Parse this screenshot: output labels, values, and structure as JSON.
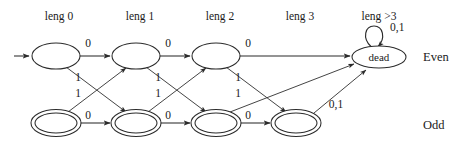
{
  "diagram": {
    "title": "",
    "column_headers": [
      {
        "label": "leng 0",
        "x": 59,
        "y": 20
      },
      {
        "label": "leng 1",
        "x": 140,
        "y": 20
      },
      {
        "label": "leng 2",
        "x": 220,
        "y": 20
      },
      {
        "label": "leng 3",
        "x": 300,
        "y": 20
      },
      {
        "label": "leng >3",
        "x": 379,
        "y": 20
      }
    ],
    "row_labels": [
      {
        "label": "Even",
        "x": 423,
        "y": 61
      },
      {
        "label": "Odd",
        "x": 423,
        "y": 129
      }
    ],
    "states": [
      {
        "id": "e0",
        "label": "",
        "cx": 56,
        "cy": 56,
        "rx": 24,
        "ry": 13,
        "accepting": false,
        "row": "even",
        "col": 0
      },
      {
        "id": "e1",
        "label": "",
        "cx": 136,
        "cy": 56,
        "rx": 24,
        "ry": 13,
        "accepting": false,
        "row": "even",
        "col": 1
      },
      {
        "id": "e2",
        "label": "",
        "cx": 216,
        "cy": 56,
        "rx": 24,
        "ry": 13,
        "accepting": false,
        "row": "even",
        "col": 2
      },
      {
        "id": "o0",
        "label": "",
        "cx": 56,
        "cy": 123,
        "rx": 24,
        "ry": 13,
        "accepting": true,
        "row": "odd",
        "col": 0
      },
      {
        "id": "o1",
        "label": "",
        "cx": 136,
        "cy": 123,
        "rx": 24,
        "ry": 13,
        "accepting": true,
        "row": "odd",
        "col": 1
      },
      {
        "id": "o2",
        "label": "",
        "cx": 216,
        "cy": 123,
        "rx": 24,
        "ry": 13,
        "accepting": true,
        "row": "odd",
        "col": 2
      },
      {
        "id": "o3",
        "label": "",
        "cx": 296,
        "cy": 123,
        "rx": 24,
        "ry": 13,
        "accepting": true,
        "row": "odd",
        "col": 3
      },
      {
        "id": "dead",
        "label": "dead",
        "cx": 379,
        "cy": 57,
        "rx": 27,
        "ry": 11,
        "accepting": false,
        "row": "even",
        "col": 4
      }
    ],
    "start_arrow": {
      "from_x": 14,
      "to_x": 30,
      "y": 56
    },
    "edge_labels": [
      {
        "label": "0",
        "x": 88,
        "y": 47
      },
      {
        "label": "0",
        "x": 168,
        "y": 47
      },
      {
        "label": "0",
        "x": 248,
        "y": 47
      },
      {
        "label": "0",
        "x": 88,
        "y": 119
      },
      {
        "label": "0",
        "x": 168,
        "y": 119
      },
      {
        "label": "0",
        "x": 248,
        "y": 119
      },
      {
        "label": "1",
        "x": 78,
        "y": 81
      },
      {
        "label": "1",
        "x": 78,
        "y": 97
      },
      {
        "label": "1",
        "x": 158,
        "y": 81
      },
      {
        "label": "1",
        "x": 158,
        "y": 97
      },
      {
        "label": "1",
        "x": 238,
        "y": 81
      },
      {
        "label": "1",
        "x": 238,
        "y": 97
      },
      {
        "label": "0,1",
        "x": 336,
        "y": 108
      },
      {
        "label": "0,1",
        "x": 390,
        "y": 31
      }
    ],
    "transitions": [
      {
        "from": "e0",
        "to": "e1",
        "symbol": "0"
      },
      {
        "from": "e1",
        "to": "e2",
        "symbol": "0"
      },
      {
        "from": "e2",
        "to": "dead",
        "symbol": "0"
      },
      {
        "from": "o0",
        "to": "o1",
        "symbol": "0"
      },
      {
        "from": "o1",
        "to": "o2",
        "symbol": "0"
      },
      {
        "from": "o2",
        "to": "o3",
        "symbol": "0"
      },
      {
        "from": "e0",
        "to": "o1",
        "symbol": "1"
      },
      {
        "from": "o0",
        "to": "e1",
        "symbol": "1"
      },
      {
        "from": "e1",
        "to": "o2",
        "symbol": "1"
      },
      {
        "from": "o1",
        "to": "e2",
        "symbol": "1"
      },
      {
        "from": "e2",
        "to": "o3",
        "symbol": "1"
      },
      {
        "from": "o2",
        "to": "dead",
        "symbol": "1"
      },
      {
        "from": "o3",
        "to": "dead",
        "symbol": "0,1"
      },
      {
        "from": "dead",
        "to": "dead",
        "symbol": "0,1"
      }
    ],
    "colors": {
      "stroke": "#2b2b2b",
      "text": "#1a1a1a",
      "background": "#ffffff"
    }
  }
}
